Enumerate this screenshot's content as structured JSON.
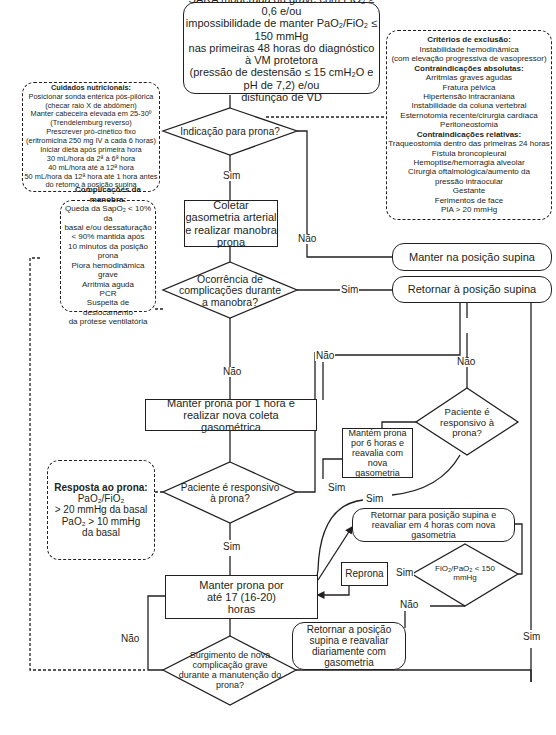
{
  "start": {
    "lines": [
      "SARA moderada ou grave com FiO₂ ≥ 0,6 e/ou",
      "impossibilidade de manter PaO₂/FiO₂ ≤ 150 mmHg",
      "nas primeiras 48 horas do diagnóstico à VM protetora",
      "(pressão de destensão ≤ 15 cmH₂O e pH de 7,2) e/ou",
      "disfunção de VD"
    ]
  },
  "exclusion": {
    "title": "Critérios de exclusão:",
    "items": [
      "Instabilidade hemodinâmica",
      "(com elevação progressiva de vasopressor)"
    ],
    "absolute_title": "Contraindicações absolutas:",
    "absolute": [
      "Arritmias graves agudas",
      "Fratura pélvica",
      "Hipertensão intracraniana",
      "Instabilidade da coluna vertebral",
      "Esternotomia recente/cirurgia cardíaca",
      "Peritoneostomia"
    ],
    "relative_title": "Contraindicações relativas:",
    "relative": [
      "Traqueostomia dentro das primeiras 24 horas",
      "Fístula broncopleural",
      "Hemoptise/hemorragia alveolar",
      "Cirurgia oftalmológica/aumento da",
      "pressão intraocular",
      "Gestante",
      "Ferimentos de face",
      "PIA > 20 mmHg"
    ]
  },
  "nutrition": {
    "title": "Cuidados nutricionais:",
    "items": [
      "Posicionar sonda entérica pós-pilórica",
      "(checar raio X de abdômen)",
      "Manter cabeceira elevada em 25-30º",
      "(Trendelemburg reverso)",
      "Prescrever pró-cinético fixo",
      "(eritromicina 250 mg IV a cada 6 horas)",
      "Iniciar dieta após primeira hora",
      "30 mL/hora da 2ª à 6ª hora",
      "40 mL/hora até a 12ª hora",
      "50 mL/hora da 12ª hora até 1 hora antes",
      "do retorno à posição supina"
    ]
  },
  "complications": {
    "title": "Complicações da manobra:",
    "items": [
      "Queda da SapO₂ < 10% da",
      "basal e/ou dessaturação",
      "< 90% mantida após",
      "10 minutos da posição prona",
      "Piora hemodinâmica grave",
      "Arritmia aguda",
      "PCR",
      "Suspeita de deslocamento",
      "da prótese ventilatória"
    ]
  },
  "response": {
    "title": "Resposta ao prona:",
    "items": [
      "PaO₂/FiO₂",
      "> 20 mmHg da basal",
      "PaO₂ > 10 mmHg",
      "da basal"
    ]
  },
  "nodes": {
    "indication": "Indicação para prona?",
    "collect": "Coletar gasometria arterial e realizar manobra prona",
    "keep_supine": "Manter na posição supina",
    "complications_q": "Ocorrência de complicações durante a manobra?",
    "return_supine": "Retornar à posição supina",
    "prone_1h": "Manter prona por 1 hora e realizar nova coleta gasométrica",
    "responsive_q1": "Paciente é responsivo à prona?",
    "responsive_q2": "Paciente é responsivo à prona?",
    "keep_6h": "Mantém prona por 6 horas e reavalia com nova gasometria",
    "return_4h": "Retornar para posição supina e reavaliar em 4 horas com nova gasometria",
    "fio2_q": "FiO₂/PaO₂ < 150 mmHg",
    "reprona": "Reprona",
    "prone_17h": "Manter prona por até 17 (16-20) horas",
    "return_daily": "Retornar a posição supina e reavaliar diariamente com gasometria",
    "new_comp_q": "Surgimento de nova complicação grave durante a manutenção do prona?"
  },
  "labels": {
    "yes": "Sim",
    "no": "Não"
  }
}
